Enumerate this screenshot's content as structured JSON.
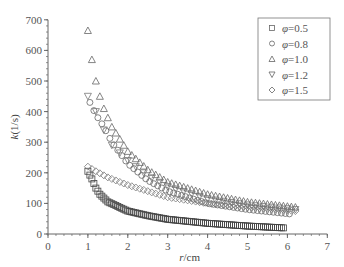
{
  "chart_data": {
    "type": "scatter",
    "title": "",
    "xlabel": "r/cm",
    "ylabel": "k(1/s)",
    "xlim": [
      0,
      7
    ],
    "ylim": [
      0,
      700
    ],
    "xticks": [
      0,
      1,
      2,
      3,
      4,
      5,
      6,
      7
    ],
    "yticks": [
      0,
      100,
      200,
      300,
      400,
      500,
      600,
      700
    ],
    "grid": false,
    "legend_position": "upper right",
    "series": [
      {
        "name": "φ=0.5",
        "marker": "square",
        "x_start": 1.0,
        "x_end": 5.9,
        "x_step": 0.05,
        "values_sampled": [
          [
            1.0,
            205
          ],
          [
            1.1,
            180
          ],
          [
            1.2,
            150
          ],
          [
            1.3,
            130
          ],
          [
            1.5,
            105
          ],
          [
            2.0,
            75
          ],
          [
            2.5,
            60
          ],
          [
            3.0,
            48
          ],
          [
            4.0,
            35
          ],
          [
            5.0,
            26
          ],
          [
            5.9,
            20
          ]
        ]
      },
      {
        "name": "φ=0.8",
        "marker": "circle",
        "x_start": 1.05,
        "x_end": 6.1,
        "x_step": 0.1,
        "values_sampled": [
          [
            1.05,
            430
          ],
          [
            1.2,
            390
          ],
          [
            1.4,
            350
          ],
          [
            1.6,
            300
          ],
          [
            2.0,
            230
          ],
          [
            2.5,
            175
          ],
          [
            3.0,
            140
          ],
          [
            4.0,
            100
          ],
          [
            5.0,
            80
          ],
          [
            6.1,
            65
          ]
        ]
      },
      {
        "name": "φ=1.0",
        "marker": "triangle-up",
        "x_start": 1.0,
        "x_end": 6.2,
        "x_step": 0.1,
        "values_sampled": [
          [
            1.0,
            665
          ],
          [
            1.1,
            570
          ],
          [
            1.2,
            500
          ],
          [
            1.3,
            450
          ],
          [
            1.4,
            410
          ],
          [
            1.6,
            350
          ],
          [
            2.0,
            270
          ],
          [
            2.5,
            210
          ],
          [
            3.0,
            170
          ],
          [
            4.0,
            130
          ],
          [
            5.0,
            105
          ],
          [
            6.2,
            88
          ]
        ]
      },
      {
        "name": "φ=1.2",
        "marker": "triangle-down",
        "x_start": 1.0,
        "x_end": 6.2,
        "x_step": 0.2,
        "values_sampled": [
          [
            1.0,
            450
          ],
          [
            1.2,
            400
          ],
          [
            1.4,
            340
          ],
          [
            1.6,
            290
          ],
          [
            2.0,
            240
          ],
          [
            2.5,
            190
          ],
          [
            3.0,
            155
          ],
          [
            4.0,
            115
          ],
          [
            5.0,
            95
          ],
          [
            6.2,
            80
          ]
        ]
      },
      {
        "name": "φ=1.5",
        "marker": "diamond",
        "x_start": 1.0,
        "x_end": 6.2,
        "x_step": 0.1,
        "values_sampled": [
          [
            1.0,
            220
          ],
          [
            1.2,
            205
          ],
          [
            1.5,
            185
          ],
          [
            2.0,
            160
          ],
          [
            2.5,
            140
          ],
          [
            3.0,
            120
          ],
          [
            4.0,
            100
          ],
          [
            5.0,
            88
          ],
          [
            6.2,
            75
          ]
        ]
      }
    ]
  },
  "legend": {
    "items": [
      "φ=0.5",
      "φ=0.8",
      "φ=1.0",
      "φ=1.2",
      "φ=1.5"
    ]
  },
  "axes": {
    "x_label": "r/cm",
    "y_label": "k(1/s)"
  }
}
